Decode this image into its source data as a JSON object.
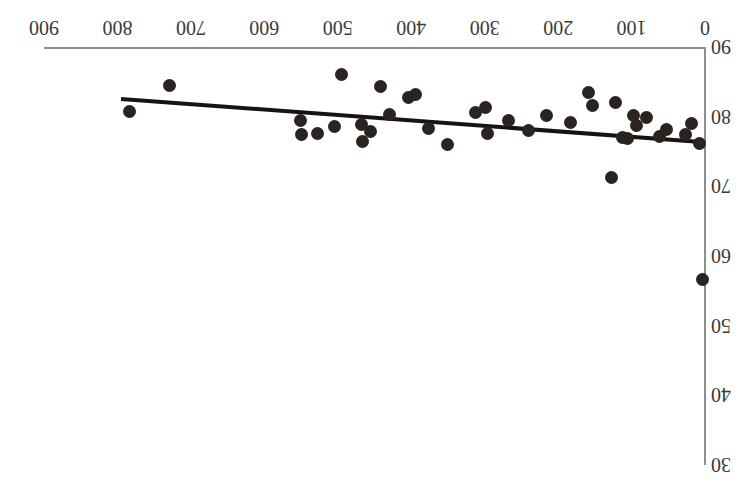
{
  "figure": {
    "orientation": "rotated-180",
    "background_color": "#ffffff",
    "axis_color": "#8e8e8e",
    "point_color": "#2a2320",
    "line_color": "#141414"
  },
  "chart_data": {
    "type": "scatter",
    "title": "",
    "subtitle": "",
    "xlabel": "",
    "ylabel": "",
    "xlim": [
      0,
      900
    ],
    "ylim": [
      30,
      90
    ],
    "y_axis_inverted": true,
    "grid": false,
    "legend": null,
    "legend_position": "none",
    "xticks": [
      0,
      100,
      200,
      300,
      400,
      500,
      600,
      700,
      800,
      900
    ],
    "xticklabels": [
      "0",
      "100",
      "200",
      "300",
      "400",
      "500",
      "600",
      "700",
      "800",
      "900"
    ],
    "yticks": [
      30,
      40,
      50,
      60,
      70,
      80,
      90
    ],
    "yticklabels": [
      "30",
      "40",
      "50",
      "60",
      "70",
      "80",
      "90"
    ],
    "points": [
      {
        "x": 783,
        "y": 80.7
      },
      {
        "x": 729,
        "y": 84.5
      },
      {
        "x": 551,
        "y": 79.5
      },
      {
        "x": 549,
        "y": 77.5
      },
      {
        "x": 527,
        "y": 77.6
      },
      {
        "x": 505,
        "y": 78.6
      },
      {
        "x": 495,
        "y": 86.0
      },
      {
        "x": 468,
        "y": 78.9
      },
      {
        "x": 466,
        "y": 76.4
      },
      {
        "x": 455,
        "y": 77.8
      },
      {
        "x": 442,
        "y": 84.3
      },
      {
        "x": 430,
        "y": 80.3
      },
      {
        "x": 404,
        "y": 82.7
      },
      {
        "x": 394,
        "y": 83.2
      },
      {
        "x": 376,
        "y": 78.3
      },
      {
        "x": 351,
        "y": 76.0
      },
      {
        "x": 313,
        "y": 80.6
      },
      {
        "x": 299,
        "y": 81.3
      },
      {
        "x": 296,
        "y": 77.6
      },
      {
        "x": 268,
        "y": 79.5
      },
      {
        "x": 240,
        "y": 78.0
      },
      {
        "x": 216,
        "y": 80.1
      },
      {
        "x": 183,
        "y": 79.2
      },
      {
        "x": 159,
        "y": 83.4
      },
      {
        "x": 153,
        "y": 81.6
      },
      {
        "x": 127,
        "y": 71.2
      },
      {
        "x": 122,
        "y": 82.0
      },
      {
        "x": 112,
        "y": 77.0
      },
      {
        "x": 105,
        "y": 76.8
      },
      {
        "x": 97,
        "y": 80.2
      },
      {
        "x": 93,
        "y": 78.8
      },
      {
        "x": 79,
        "y": 79.9
      },
      {
        "x": 62,
        "y": 77.1
      },
      {
        "x": 52,
        "y": 78.1
      },
      {
        "x": 27,
        "y": 77.4
      },
      {
        "x": 19,
        "y": 79.0
      },
      {
        "x": 8,
        "y": 76.2
      },
      {
        "x": 3,
        "y": 56.6
      }
    ],
    "trendline": {
      "type": "linear-fit",
      "x_start": 795,
      "y_start": 82.5,
      "x_end": 0,
      "y_end": 76.3
    }
  }
}
